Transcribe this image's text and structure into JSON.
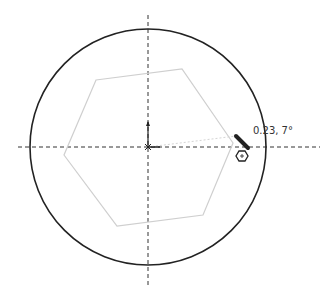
{
  "canvas": {
    "tooltip_label": "0.23, 7°",
    "circle": {
      "cx": 148,
      "cy": 147,
      "r": 118,
      "color": "#222222"
    },
    "polygon": {
      "points": "96,80 182,69 233,143 203,215 117,226 64,155",
      "color": "#cccccc"
    },
    "axes_color": "#333333",
    "cursor_icon": "pencil-icon",
    "snap_icon": "hexagon-snap-icon"
  }
}
